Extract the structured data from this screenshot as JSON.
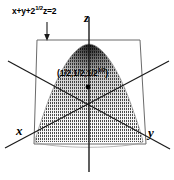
{
  "figure": {
    "plane_equation": {
      "lhs_a": "x+y+2",
      "exponent": "1/2",
      "lhs_b": "z=2"
    },
    "interior_point": {
      "prefix": "(1/2,1/2,1/2",
      "exponent": "1/2",
      "suffix": ")"
    },
    "axes": {
      "x": "x",
      "y": "y",
      "z": "z"
    },
    "colors": {
      "stroke": "#1a1a1a",
      "plane_stroke": "#555555",
      "stipple": "#3a3a3a",
      "background": "#ffffff"
    },
    "geometry": {
      "origin": [
        89,
        105
      ],
      "apex": [
        89,
        44
      ],
      "point_marker": [
        88,
        87
      ],
      "plane_corners": [
        [
          37,
          40
        ],
        [
          140,
          40
        ],
        [
          146,
          144
        ],
        [
          34,
          144
        ]
      ]
    }
  }
}
